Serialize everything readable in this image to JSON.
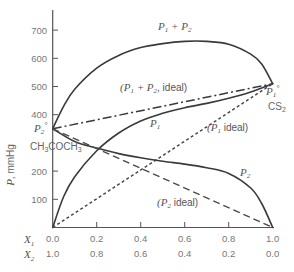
{
  "chart_data": {
    "type": "line",
    "title": "",
    "xlabel": "X1 / X2 (mole fraction)",
    "ylabel": "P, mmHg",
    "x_axis": {
      "primary_label": "X1",
      "secondary_label": "X2",
      "ticks_primary": [
        "0.0",
        "0.2",
        "0.4",
        "0.6",
        "0.8",
        "1.0"
      ],
      "ticks_secondary": [
        "1.0",
        "0.8",
        "0.6",
        "0.4",
        "0.2",
        "0.0"
      ],
      "range": [
        0,
        1
      ]
    },
    "y_axis": {
      "ticks": [
        "100",
        "200",
        "400",
        "500",
        "600",
        "700"
      ],
      "range": [
        0,
        750
      ]
    },
    "grid": false,
    "legend": "inline curve labels",
    "annotations": {
      "p1_pure": "P1°",
      "p1_compound": "CS2",
      "p2_pure": "P2°",
      "p2_compound": "CH3COCH3"
    },
    "series": [
      {
        "name": "P1 + P2",
        "style": "solid",
        "x": [
          0.0,
          0.05,
          0.1,
          0.2,
          0.3,
          0.4,
          0.5,
          0.6,
          0.7,
          0.8,
          0.9,
          0.95,
          1.0
        ],
        "values": [
          350,
          430,
          490,
          565,
          610,
          638,
          652,
          660,
          660,
          650,
          615,
          580,
          510
        ]
      },
      {
        "name": "P1 + P2, ideal",
        "style": "dash-dot",
        "x": [
          0.0,
          1.0
        ],
        "values": [
          350,
          510
        ]
      },
      {
        "name": "P1",
        "style": "solid",
        "x": [
          0.0,
          0.05,
          0.1,
          0.2,
          0.3,
          0.4,
          0.5,
          0.6,
          0.7,
          0.8,
          0.9,
          1.0
        ],
        "values": [
          0,
          110,
          180,
          272,
          335,
          378,
          405,
          425,
          440,
          458,
          480,
          510
        ]
      },
      {
        "name": "P1 ideal",
        "style": "dashed-short",
        "x": [
          0.0,
          1.0
        ],
        "values": [
          0,
          510
        ]
      },
      {
        "name": "P2",
        "style": "solid",
        "x": [
          0.0,
          0.1,
          0.2,
          0.3,
          0.4,
          0.5,
          0.6,
          0.7,
          0.8,
          0.9,
          0.95,
          1.0
        ],
        "values": [
          350,
          305,
          282,
          262,
          247,
          235,
          225,
          212,
          192,
          140,
          85,
          0
        ]
      },
      {
        "name": "P2 ideal",
        "style": "dashed-long",
        "x": [
          0.0,
          1.0
        ],
        "values": [
          350,
          0
        ]
      }
    ]
  },
  "labels": {
    "sum": "P1 + P2",
    "sum_ideal": "(P1 + P2, ideal)",
    "p1": "P1",
    "p1_ideal": "(P1 ideal)",
    "p2": "P2",
    "p2_ideal": "(P2 ideal)",
    "ylabel": "P, mmHg",
    "x1": "X1",
    "x2": "X2",
    "cs2": "CS2",
    "acetone": "CH3COCH3"
  }
}
